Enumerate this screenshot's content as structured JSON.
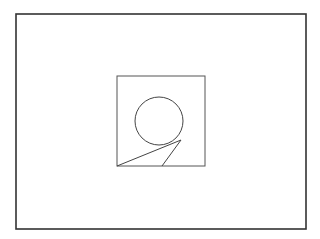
{
  "diagram": {
    "type": "geometric-figure",
    "outer_frame": {
      "x": 16,
      "y": 14,
      "width": 290,
      "height": 215,
      "stroke": "#333333",
      "stroke_width": 1.6
    },
    "inner_square": {
      "x": 117,
      "y": 76,
      "width": 88,
      "height": 90,
      "stroke": "#555555",
      "stroke_width": 1
    },
    "circle": {
      "cx": 159,
      "cy": 121,
      "r": 24,
      "stroke": "#444444",
      "stroke_width": 1
    },
    "tangent_point": {
      "x": 181,
      "y": 140
    },
    "lines": [
      {
        "x1": 117,
        "y1": 166,
        "x2": 181,
        "y2": 140,
        "stroke": "#444444"
      },
      {
        "x1": 162,
        "y1": 166,
        "x2": 181,
        "y2": 140,
        "stroke": "#444444"
      }
    ]
  }
}
